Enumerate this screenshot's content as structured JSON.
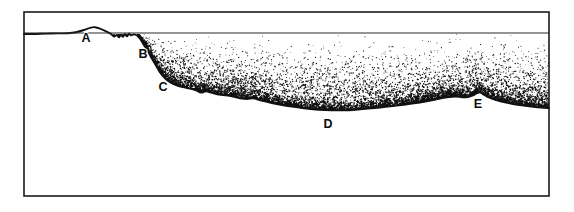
{
  "figure": {
    "background_color": "#ffffff",
    "frame": {
      "name": "diagram-border",
      "color": "#1a1a1a",
      "x": 24,
      "y": 12,
      "width": 525,
      "height": 184,
      "stroke_width": 1.6
    },
    "datum_line": {
      "name": "water-surface-line",
      "color": "#2a2a2a",
      "y": 33,
      "x_start": 24,
      "x_end": 549,
      "stroke_width": 1.1
    },
    "profile": {
      "name": "terrain-profile-line",
      "color": "#111111",
      "stroke_width": 1.9,
      "points": [
        [
          24,
          34
        ],
        [
          34,
          34
        ],
        [
          46,
          33.6
        ],
        [
          58,
          33.4
        ],
        [
          68,
          33.2
        ],
        [
          76,
          32.2
        ],
        [
          84,
          30.0
        ],
        [
          90,
          27.8
        ],
        [
          95,
          27.2
        ],
        [
          100,
          28.6
        ],
        [
          106,
          31.4
        ],
        [
          111,
          34.0
        ],
        [
          114,
          36.6
        ],
        [
          117,
          35.0
        ],
        [
          119,
          37.4
        ],
        [
          121,
          34.6
        ],
        [
          123,
          36.8
        ],
        [
          125,
          34.0
        ],
        [
          127,
          36.4
        ],
        [
          129,
          33.6
        ],
        [
          131,
          35.2
        ],
        [
          134,
          34.4
        ],
        [
          137,
          35.6
        ],
        [
          140,
          38.8
        ],
        [
          143,
          43.6
        ],
        [
          146,
          48.6
        ],
        [
          149,
          53.2
        ],
        [
          152,
          58.8
        ],
        [
          156,
          65.6
        ],
        [
          160,
          72.4
        ],
        [
          165,
          78.2
        ],
        [
          170,
          82.2
        ],
        [
          176,
          85.0
        ],
        [
          183,
          87.2
        ],
        [
          190,
          88.6
        ],
        [
          196,
          90.4
        ],
        [
          201,
          92.6
        ],
        [
          206,
          91.4
        ],
        [
          212,
          92.8
        ],
        [
          219,
          94.6
        ],
        [
          226,
          95.4
        ],
        [
          233,
          96.6
        ],
        [
          240,
          98.2
        ],
        [
          247,
          99.0
        ],
        [
          253,
          98.2
        ],
        [
          258,
          99.6
        ],
        [
          265,
          101.4
        ],
        [
          273,
          103.2
        ],
        [
          282,
          105.0
        ],
        [
          292,
          106.6
        ],
        [
          302,
          108.0
        ],
        [
          313,
          109.2
        ],
        [
          325,
          110.0
        ],
        [
          337,
          110.4
        ],
        [
          349,
          110.2
        ],
        [
          360,
          109.4
        ],
        [
          371,
          108.4
        ],
        [
          382,
          107.2
        ],
        [
          393,
          106.0
        ],
        [
          404,
          104.8
        ],
        [
          414,
          103.4
        ],
        [
          424,
          101.8
        ],
        [
          433,
          100.0
        ],
        [
          441,
          98.2
        ],
        [
          449,
          97.0
        ],
        [
          456,
          96.6
        ],
        [
          462,
          97.2
        ],
        [
          468,
          97.0
        ],
        [
          473,
          95.4
        ],
        [
          477,
          93.2
        ],
        [
          480,
          92.2
        ],
        [
          483,
          94.2
        ],
        [
          487,
          96.6
        ],
        [
          492,
          98.6
        ],
        [
          498,
          100.6
        ],
        [
          505,
          102.4
        ],
        [
          513,
          104.0
        ],
        [
          522,
          105.4
        ],
        [
          532,
          106.6
        ],
        [
          541,
          107.6
        ],
        [
          549,
          108.2
        ]
      ]
    },
    "stipple": {
      "name": "sediment-stipple-fill",
      "description": "graded dot shading dense near the seafloor, fading upward to the water surface line",
      "dot_color": "#101010",
      "top_y": 34,
      "dot_count": 5200,
      "dot_radius_min": 0.38,
      "dot_radius_max": 0.78
    },
    "labels": [
      {
        "id": "A",
        "text": "A",
        "x": 86,
        "y": 42,
        "name": "point-label-a"
      },
      {
        "id": "B",
        "text": "B",
        "x": 143,
        "y": 58,
        "name": "point-label-b"
      },
      {
        "id": "C",
        "text": "C",
        "x": 163,
        "y": 91,
        "name": "point-label-c"
      },
      {
        "id": "D",
        "text": "D",
        "x": 328,
        "y": 128,
        "name": "point-label-d"
      },
      {
        "id": "E",
        "text": "E",
        "x": 478,
        "y": 108,
        "name": "point-label-e"
      }
    ]
  }
}
